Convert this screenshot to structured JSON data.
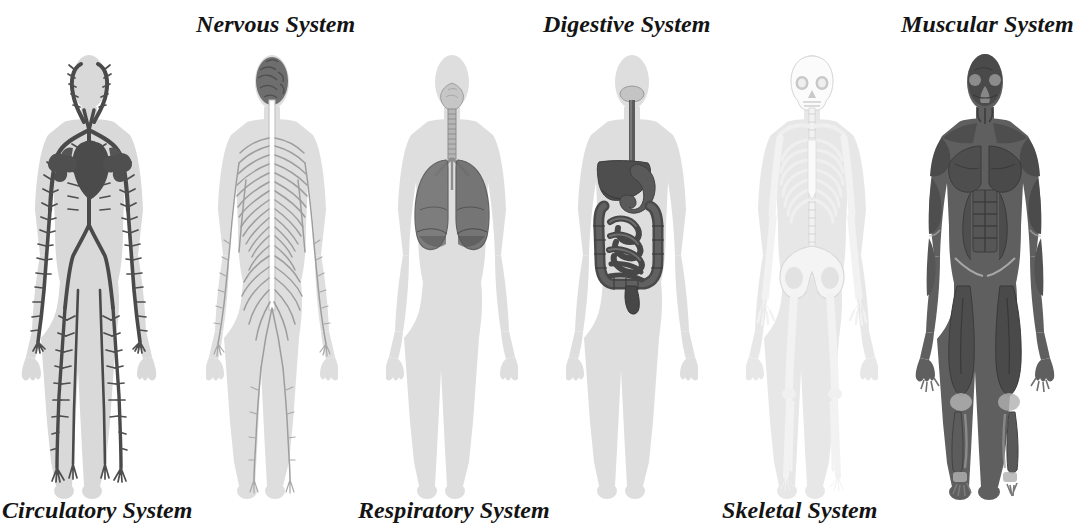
{
  "figure_title": "Human Body Systems",
  "background_color": "#ffffff",
  "text_color": "#141414",
  "labels": {
    "top": [
      {
        "id": "nervous",
        "text": "Nervous System",
        "x": 196,
        "y": 11
      },
      {
        "id": "digestive",
        "text": "Digestive System",
        "x": 543,
        "y": 11
      },
      {
        "id": "muscular",
        "text": "Muscular System",
        "x": 901,
        "y": 11
      }
    ],
    "bottom": [
      {
        "id": "circulatory",
        "text": "Circulatory System",
        "x": 2,
        "y": 497
      },
      {
        "id": "respiratory",
        "text": "Respiratory System",
        "x": 358,
        "y": 497
      },
      {
        "id": "skeletal",
        "text": "Skeletal System",
        "x": 722,
        "y": 497
      }
    ]
  },
  "systems": [
    {
      "id": "circulatory",
      "name": "Circulatory System",
      "label_position": "bottom",
      "center_x": 88,
      "body_tint": "#d8d8d8",
      "organ_color": "#555555",
      "organ_dark": "#3a3a3a",
      "organs": [
        "heart",
        "arteries",
        "veins",
        "capillary-network"
      ]
    },
    {
      "id": "nervous",
      "name": "Nervous System",
      "label_position": "top",
      "center_x": 272,
      "body_tint": "#dcdcdc",
      "organ_color": "#9a9a9a",
      "organ_dark": "#4a4a4a",
      "organs": [
        "brain",
        "spinal-cord",
        "peripheral-nerves"
      ]
    },
    {
      "id": "respiratory",
      "name": "Respiratory System",
      "label_position": "bottom",
      "center_x": 452,
      "body_tint": "#dcdcdc",
      "organ_color": "#7d7d7d",
      "organ_dark": "#4f4f4f",
      "organs": [
        "nasal-cavity",
        "trachea",
        "bronchi",
        "lungs"
      ]
    },
    {
      "id": "digestive",
      "name": "Digestive System",
      "label_position": "top",
      "center_x": 632,
      "body_tint": "#dcdcdc",
      "organ_color": "#5e5e5e",
      "organ_dark": "#3f3f3f",
      "organs": [
        "mouth",
        "esophagus",
        "liver",
        "stomach",
        "small-intestine",
        "large-intestine",
        "rectum"
      ]
    },
    {
      "id": "skeletal",
      "name": "Skeletal System",
      "label_position": "bottom",
      "center_x": 812,
      "body_tint": "#e4e4e4",
      "organ_color": "#f4f4f4",
      "organ_dark": "#cfcfcf",
      "organs": [
        "skull",
        "spine",
        "ribcage",
        "pelvis",
        "limb-bones"
      ]
    },
    {
      "id": "muscular",
      "name": "Muscular System",
      "label_position": "top",
      "center_x": 985,
      "body_tint": "#bdbdbd",
      "organ_color": "#5a5a5a",
      "organ_dark": "#3c3c3c",
      "organs": [
        "facial-muscles",
        "pectorals",
        "abdominals",
        "biceps",
        "quadriceps",
        "calves"
      ]
    }
  ]
}
